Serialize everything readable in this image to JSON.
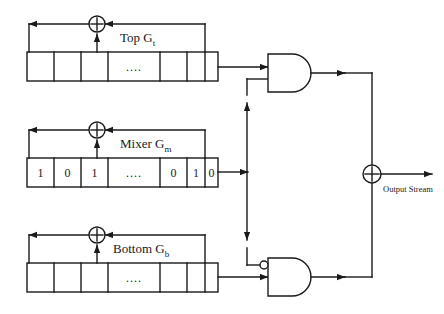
{
  "diagram": {
    "type": "block-diagram",
    "stroke_color": "#1a1a1a",
    "background": "#ffffff",
    "registers": [
      {
        "id": "top",
        "label_text": "Top G",
        "label_sub": "t",
        "cells": [
          "",
          "",
          "",
          "....",
          "",
          "",
          ""
        ],
        "feedback_icon": "xor-circle-icon"
      },
      {
        "id": "mixer",
        "label_text": "Mixer G",
        "label_sub": "m",
        "cells": [
          "1",
          "0",
          "1",
          "....",
          "0",
          "1",
          "0"
        ],
        "feedback_icon": "xor-circle-icon"
      },
      {
        "id": "bottom",
        "label_text": "Bottom G",
        "label_sub": "b",
        "cells": [
          "",
          "",
          "",
          "....",
          "",
          "",
          ""
        ],
        "feedback_icon": "xor-circle-icon"
      }
    ],
    "gates": [
      {
        "id": "and-top",
        "kind": "and-gate",
        "inverted_input": false
      },
      {
        "id": "and-bottom",
        "kind": "and-gate",
        "inverted_input": true
      },
      {
        "id": "xor-output",
        "kind": "xor-circle-icon"
      }
    ],
    "output": {
      "label": "Output Stream"
    }
  }
}
